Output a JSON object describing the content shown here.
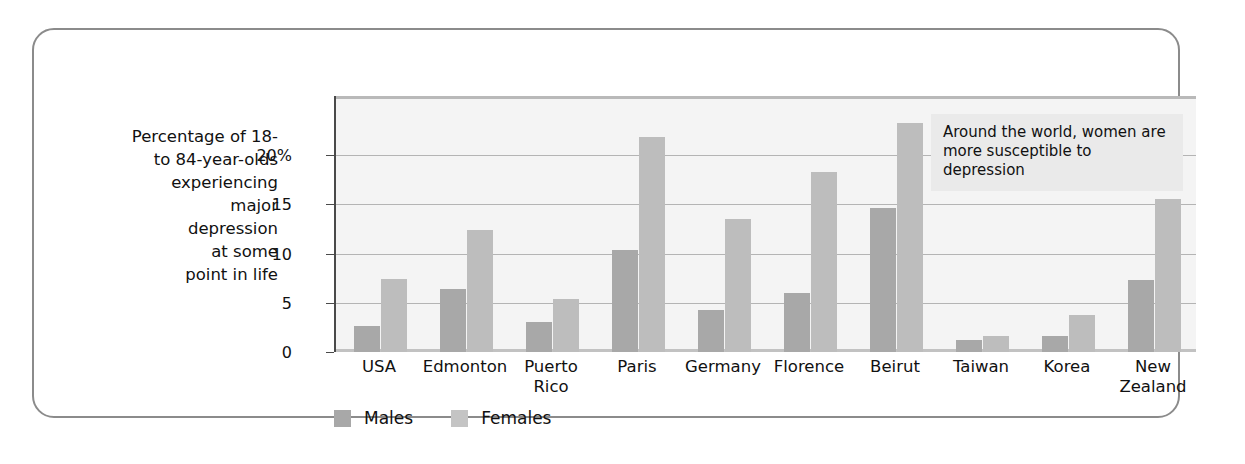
{
  "axis_title": "Percentage of 18-\nto 84-year-olds\nexperiencing\nmajor\ndepression\nat some\npoint in life",
  "annotation": "Around the world, women are more susceptible to depression",
  "legend": {
    "male_label": "Males",
    "female_label": "Females"
  },
  "colors": {
    "male_bar": "#a8a8a8",
    "female_bar": "#bdbdbd",
    "plot_background": "#f4f4f4",
    "gridline": "#b4b4b4",
    "frame_border": "#8b8b8b",
    "annotation_background": "#eaeaea",
    "text": "#111111"
  },
  "chart_data": {
    "type": "bar",
    "title": "",
    "xlabel": "",
    "ylabel": "Percentage of 18- to 84-year-olds experiencing major depression at some point in life",
    "categories": [
      "USA",
      "Edmonton",
      "Puerto\nRico",
      "Paris",
      "Germany",
      "Florence",
      "Beirut",
      "Taiwan",
      "Korea",
      "New\nZealand"
    ],
    "series": [
      {
        "name": "Males",
        "values": [
          2.6,
          6.4,
          3.0,
          10.4,
          4.3,
          6.0,
          14.6,
          1.2,
          1.6,
          7.3
        ]
      },
      {
        "name": "Females",
        "values": [
          7.4,
          12.4,
          5.4,
          21.8,
          13.5,
          18.3,
          23.3,
          1.6,
          3.8,
          15.5
        ]
      }
    ],
    "ylim": [
      0,
      26
    ],
    "yticks": [
      0,
      5,
      10,
      15,
      20
    ],
    "ytick_labels": [
      "0",
      "5",
      "10",
      "15",
      "20%"
    ],
    "grid": true,
    "legend_position": "bottom-left"
  }
}
